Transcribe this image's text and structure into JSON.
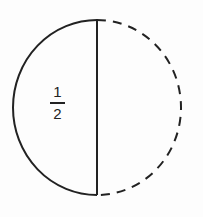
{
  "diagram": {
    "left_half_label": {
      "numerator": "1",
      "denominator": "2"
    },
    "stroke_color": "#222222",
    "background_color": "#fdfdfd"
  }
}
